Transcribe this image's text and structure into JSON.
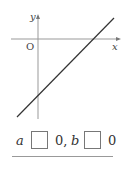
{
  "graph": {
    "y_axis_label": "y",
    "x_axis_label": "x",
    "origin_label": "O",
    "line": {
      "slope_sign": "positive",
      "y_intercept_sign": "negative",
      "x_intercept_sign": "positive"
    },
    "colors": {
      "axis": "#999999",
      "line": "#333333"
    }
  },
  "answer": {
    "var_a": "a",
    "after_first_blank": "0,",
    "var_b": "b",
    "after_second_blank": "0"
  }
}
